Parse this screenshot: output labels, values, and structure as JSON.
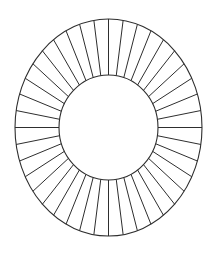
{
  "diagram": {
    "type": "segmented-annulus",
    "canvas": {
      "width": 218,
      "height": 260,
      "background": "#ffffff"
    },
    "center": {
      "x": 108.5,
      "y": 127.5
    },
    "outer_ellipse": {
      "rx": 93.5,
      "ry": 108.5
    },
    "inner_ellipse": {
      "rx": 49.5,
      "ry": 52.5
    },
    "spoke_count": 40,
    "spoke_start_angle_deg": 0,
    "line_color": "#2e2e2e"
  }
}
